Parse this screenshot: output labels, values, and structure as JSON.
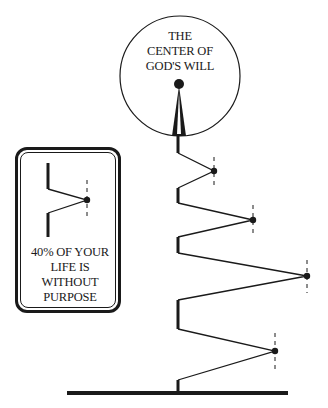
{
  "circle": {
    "title_lines": [
      "THE",
      "CENTER OF",
      "GOD'S WILL"
    ]
  },
  "legend": {
    "caption_lines": [
      "40% OF YOUR",
      "LIFE IS",
      "WITHOUT",
      "PURPOSE"
    ]
  },
  "colors": {
    "ink": "#1a1a1a",
    "background": "#ffffff"
  }
}
